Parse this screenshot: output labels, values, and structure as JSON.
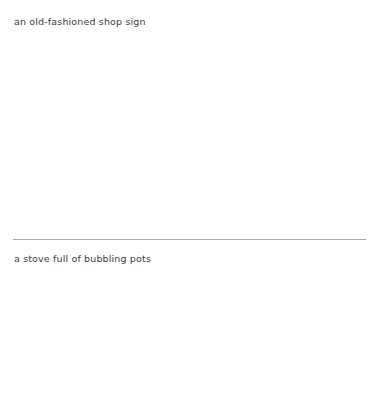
{
  "page": {
    "background_color": "#ffffff",
    "text_color": "#3b3b3b",
    "rule_color": "#a9a9a9"
  },
  "entries": [
    {
      "id": "entry-1",
      "caption": "an old-fashioned shop sign"
    },
    {
      "id": "entry-2",
      "caption": "a stove full of bubbling pots"
    }
  ],
  "separator": {
    "name": "horizontal-rule"
  }
}
